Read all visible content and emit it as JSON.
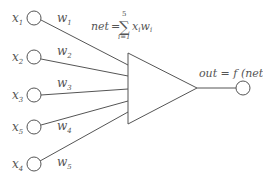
{
  "diagram": {
    "inputs": [
      {
        "var": "x",
        "sub": "1",
        "weight": "w",
        "wsub": "1",
        "cy": 18
      },
      {
        "var": "x",
        "sub": "2",
        "weight": "w",
        "wsub": "2",
        "cy": 57
      },
      {
        "var": "x",
        "sub": "3",
        "weight": "w",
        "wsub": "3",
        "cy": 95
      },
      {
        "var": "x",
        "sub": "5",
        "weight": "w",
        "wsub": "4",
        "cy": 127
      },
      {
        "var": "x",
        "sub": "4",
        "weight": "w",
        "wsub": "5",
        "cy": 164
      }
    ],
    "net_equation": {
      "lhs": "net",
      "equals": "=",
      "sum_upper": "5",
      "sum_lower": "i=1",
      "term_x": "x",
      "term_x_sub": "i",
      "term_w": "w",
      "term_w_sub": "i"
    },
    "output_equation": "out = f (net)",
    "colors": {
      "stroke": "#555555",
      "text": "#555555"
    }
  }
}
